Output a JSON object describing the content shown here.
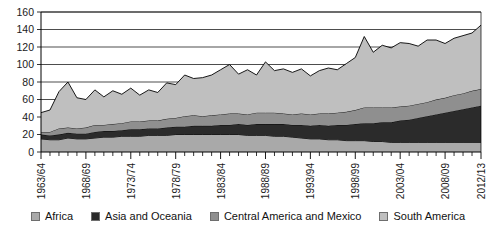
{
  "chart_data": {
    "type": "area",
    "stacked": true,
    "title": "",
    "subtitle": "",
    "xlabel": "",
    "ylabel": "",
    "ylim": [
      0,
      160
    ],
    "ytick_step": 20,
    "grid": true,
    "legend_position": "bottom",
    "ytick_labels": [
      "0",
      "20",
      "40",
      "60",
      "80",
      "100",
      "120",
      "140",
      "160"
    ],
    "xtick_labels": [
      "1963/64",
      "1968/69",
      "1973/74",
      "1978/79",
      "1983/84",
      "1988/89",
      "1993/94",
      "1998/99",
      "2003/04",
      "2008/09",
      "2012/13"
    ],
    "xtick_indices": [
      0,
      5,
      10,
      15,
      20,
      25,
      30,
      35,
      40,
      45,
      49
    ],
    "categories": [
      "1963/64",
      "1964/65",
      "1965/66",
      "1966/67",
      "1967/68",
      "1968/69",
      "1969/70",
      "1970/71",
      "1971/72",
      "1972/73",
      "1973/74",
      "1974/75",
      "1975/76",
      "1976/77",
      "1977/78",
      "1978/79",
      "1979/80",
      "1980/81",
      "1981/82",
      "1982/83",
      "1983/84",
      "1984/85",
      "1985/86",
      "1986/87",
      "1987/88",
      "1988/89",
      "1989/90",
      "1990/91",
      "1991/92",
      "1992/93",
      "1993/94",
      "1994/95",
      "1995/96",
      "1996/97",
      "1997/98",
      "1998/99",
      "1999/00",
      "2000/01",
      "2001/02",
      "2002/03",
      "2003/04",
      "2004/05",
      "2005/06",
      "2006/07",
      "2007/08",
      "2008/09",
      "2009/10",
      "2010/11",
      "2011/12",
      "2012/13"
    ],
    "series": [
      {
        "name": "Africa",
        "color": "#a9a9a9",
        "values": [
          15,
          14,
          14,
          16,
          15,
          15,
          16,
          17,
          17,
          18,
          18,
          18,
          19,
          19,
          19,
          20,
          20,
          20,
          20,
          20,
          20,
          20,
          20,
          19,
          19,
          19,
          18,
          18,
          17,
          16,
          15,
          15,
          14,
          14,
          13,
          13,
          13,
          12,
          12,
          11,
          11,
          11,
          11,
          11,
          11,
          11,
          11,
          11,
          11,
          11
        ]
      },
      {
        "name": "Asia and Oceania",
        "color": "#2b2b2b",
        "values": [
          5,
          5,
          6,
          6,
          6,
          6,
          7,
          7,
          7,
          7,
          8,
          8,
          8,
          8,
          9,
          9,
          9,
          10,
          10,
          10,
          11,
          11,
          12,
          12,
          13,
          13,
          14,
          14,
          14,
          15,
          15,
          16,
          16,
          17,
          18,
          19,
          20,
          21,
          22,
          23,
          25,
          26,
          28,
          30,
          32,
          34,
          36,
          38,
          40,
          42
        ]
      },
      {
        "name": "Central America and Mexico",
        "color": "#8f8f8f",
        "values": [
          3,
          4,
          7,
          6,
          6,
          7,
          8,
          7,
          8,
          8,
          9,
          9,
          9,
          9,
          10,
          10,
          12,
          12,
          11,
          12,
          12,
          13,
          12,
          12,
          13,
          13,
          13,
          12,
          12,
          13,
          13,
          13,
          14,
          14,
          15,
          16,
          18,
          18,
          17,
          17,
          16,
          16,
          16,
          16,
          17,
          17,
          18,
          18,
          19,
          19
        ]
      },
      {
        "name": "South America",
        "color": "#bfbfbf",
        "values": [
          22,
          25,
          42,
          52,
          35,
          32,
          40,
          32,
          38,
          33,
          38,
          30,
          35,
          32,
          41,
          38,
          47,
          42,
          44,
          46,
          51,
          56,
          45,
          51,
          43,
          58,
          48,
          51,
          48,
          51,
          44,
          49,
          52,
          49,
          55,
          60,
          81,
          63,
          71,
          68,
          73,
          71,
          66,
          71,
          68,
          62,
          65,
          66,
          66,
          73
        ]
      }
    ],
    "totals": [
      45,
      48,
      69,
      80,
      62,
      60,
      71,
      63,
      70,
      66,
      73,
      65,
      71,
      68,
      79,
      77,
      88,
      84,
      85,
      88,
      94,
      100,
      89,
      94,
      88,
      103,
      93,
      95,
      91,
      95,
      87,
      93,
      96,
      94,
      101,
      108,
      132,
      114,
      122,
      119,
      125,
      124,
      121,
      128,
      128,
      124,
      130,
      133,
      136,
      145
    ]
  },
  "legend": {
    "items": [
      {
        "label": "Africa",
        "color": "#a9a9a9"
      },
      {
        "label": "Asia and Oceania",
        "color": "#2b2b2b"
      },
      {
        "label": "Central America and Mexico",
        "color": "#8f8f8f"
      },
      {
        "label": "South America",
        "color": "#bfbfbf"
      }
    ]
  }
}
